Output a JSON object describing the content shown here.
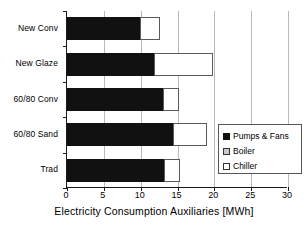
{
  "chart_data": {
    "type": "bar",
    "orientation": "horizontal",
    "stacked": true,
    "title": "",
    "xlabel": "Electricity Consumption Auxiliaries [MWh]",
    "ylabel": "",
    "xlim": [
      0,
      30
    ],
    "xticks": [
      0,
      5,
      10,
      15,
      20,
      25,
      30
    ],
    "xtick_labels": [
      "0",
      "5",
      "10",
      "15",
      "20",
      "25",
      "30"
    ],
    "grid": "vertical",
    "legend_position": "lower-right-inside",
    "categories": [
      "New Conv",
      "New Glaze",
      "60/80 Conv",
      "60/80 Sand",
      "Trad"
    ],
    "series": [
      {
        "name": "Pumps & Fans",
        "color": "#111111",
        "values": [
          10.0,
          12.0,
          13.2,
          14.5,
          13.3
        ]
      },
      {
        "name": "Boiler",
        "color": "#c9c9c9",
        "values": [
          0,
          0,
          0,
          0,
          0
        ]
      },
      {
        "name": "Chiller",
        "color": "#ffffff",
        "values": [
          2.8,
          8.0,
          2.1,
          4.7,
          2.2
        ]
      }
    ],
    "totals": [
      12.8,
      20.0,
      15.3,
      19.2,
      15.5
    ]
  },
  "legend": {
    "items": [
      {
        "label": "Pumps & Fans",
        "swatch": "pumps-fans-swatch"
      },
      {
        "label": "Boiler",
        "swatch": "boiler-swatch"
      },
      {
        "label": "Chiller",
        "swatch": "chiller-swatch"
      }
    ]
  },
  "axis": {
    "x_title": "Electricity Consumption Auxiliaries [MWh]"
  }
}
